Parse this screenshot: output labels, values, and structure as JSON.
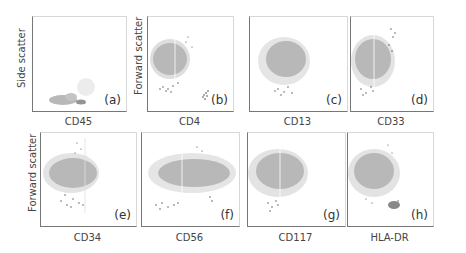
{
  "figure": {
    "y_labels": {
      "row1_a": "Side scatter",
      "row1_b": "Forward scatter",
      "row2": "Forward scatter"
    },
    "panels": [
      {
        "id": "a",
        "label": "(a)",
        "xlabel": "CD45",
        "ylabel": "Side scatter"
      },
      {
        "id": "b",
        "label": "(b)",
        "xlabel": "CD4",
        "ylabel": "Forward scatter"
      },
      {
        "id": "c",
        "label": "(c)",
        "xlabel": "CD13",
        "ylabel": "Forward scatter"
      },
      {
        "id": "d",
        "label": "(d)",
        "xlabel": "CD33",
        "ylabel": "Forward scatter"
      },
      {
        "id": "e",
        "label": "(e)",
        "xlabel": "CD34",
        "ylabel": "Forward scatter"
      },
      {
        "id": "f",
        "label": "(f)",
        "xlabel": "CD56",
        "ylabel": "Forward scatter"
      },
      {
        "id": "g",
        "label": "(g)",
        "xlabel": "CD117",
        "ylabel": "Forward scatter"
      },
      {
        "id": "h",
        "label": "(h)",
        "xlabel": "HLA-DR",
        "ylabel": "Forward scatter"
      }
    ],
    "colors": {
      "main_population": "#b8b8b8",
      "dark_events": "#333333",
      "axis": "#777777"
    }
  }
}
